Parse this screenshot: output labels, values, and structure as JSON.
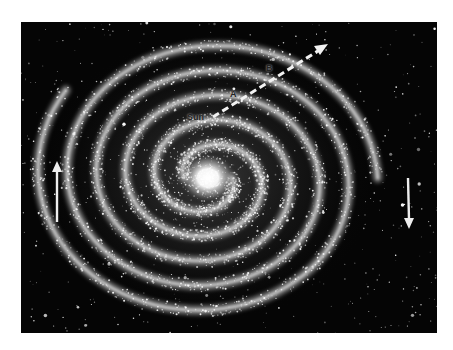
{
  "image": {
    "subject": "Spiral galaxy illustration (Milky Way style) with rotation arrows and a dashed line from the Sun outward",
    "background_color": "#050505",
    "frame_color": "#ffffff"
  },
  "labels": {
    "sun": "Sun",
    "point_a": "A",
    "point_b": "B"
  },
  "icons": {
    "left_arrow": "arrow-up-icon",
    "right_arrow": "arrow-down-icon",
    "dashed_arrow": "dashed-arrow-icon"
  },
  "colors": {
    "stars": "#ffffff",
    "core": "#ffffff",
    "arms": "#d8d8d8",
    "label_text": "#222222"
  }
}
